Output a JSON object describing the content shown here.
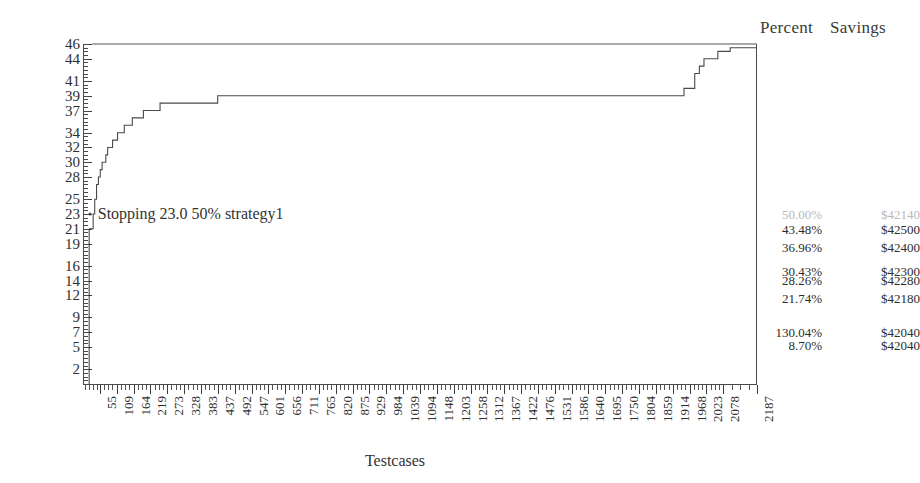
{
  "chart_data": {
    "type": "line",
    "title": "",
    "xlabel": "Testcases",
    "ylabel": "Faliures",
    "grid": false,
    "legend_position": "none",
    "xlim": [
      0,
      2187
    ],
    "ylim": [
      0,
      46
    ],
    "y_ticks": [
      46,
      44,
      41,
      39,
      37,
      34,
      32,
      30,
      28,
      25,
      23,
      21,
      19,
      16,
      14,
      12,
      9,
      7,
      5,
      2
    ],
    "x_ticks": [
      55,
      109,
      164,
      219,
      273,
      328,
      383,
      437,
      492,
      547,
      601,
      656,
      711,
      765,
      820,
      875,
      929,
      984,
      1039,
      1094,
      1148,
      1203,
      1258,
      1312,
      1367,
      1422,
      1476,
      1531,
      1586,
      1640,
      1695,
      1750,
      1804,
      1859,
      1914,
      1968,
      2023,
      2078,
      2187
    ],
    "series": [
      {
        "name": "total-reference",
        "color": "#555555",
        "x": [
          30,
          2187
        ],
        "values": [
          46,
          46
        ]
      },
      {
        "name": "cumulative-failures",
        "color": "#4a4a4a",
        "x": [
          20,
          28,
          33,
          38,
          44,
          50,
          56,
          62,
          68,
          74,
          80,
          88,
          96,
          104,
          112,
          122,
          134,
          146,
          160,
          176,
          196,
          220,
          250,
          285,
          330,
          380,
          437,
          500,
          560,
          620,
          700,
          800,
          900,
          1000,
          1100,
          1200,
          1300,
          1400,
          1500,
          1600,
          1700,
          1800,
          1900,
          1950,
          1985,
          2000,
          2015,
          2030,
          2060,
          2100,
          2187
        ],
        "values": [
          21,
          21,
          23,
          25,
          27,
          28,
          29,
          30,
          30,
          31,
          32,
          32,
          33,
          33,
          34,
          34,
          35,
          35,
          36,
          36,
          37,
          37,
          38,
          38,
          38,
          38,
          39,
          39,
          39,
          39,
          39,
          39,
          39,
          39,
          39,
          39,
          39,
          39,
          39,
          39,
          39,
          39,
          39,
          40,
          42,
          43,
          44,
          44,
          45,
          45.5,
          45.5
        ]
      }
    ],
    "annotations": [
      {
        "text": "Stopping 23.0 50% strategy1",
        "x": 22,
        "y": 23
      }
    ]
  },
  "header": {
    "percent_label": "Percent",
    "savings_label": "Savings"
  },
  "axes": {
    "y_title": "Faliures",
    "x_title": "Testcases"
  },
  "annotation": {
    "stopping_text": "Stopping 23.0 50% strategy1"
  },
  "table": {
    "columns": [
      "Percent",
      "Savings"
    ],
    "rows": [
      {
        "percent": "50.00%",
        "savings": "$42140",
        "y": 23.0,
        "style": "faded"
      },
      {
        "percent": "43.48%",
        "savings": "$42500",
        "y": 21.0,
        "style": "normal"
      },
      {
        "percent": "36.96%",
        "savings": "$42400",
        "y": 18.6,
        "style": "normal"
      },
      {
        "percent": "30.43%",
        "savings": "$42300",
        "y": 15.3,
        "style": "normal"
      },
      {
        "percent": "28.26%",
        "savings": "$42280",
        "y": 14.1,
        "style": "normal"
      },
      {
        "percent": "21.74%",
        "savings": "$42180",
        "y": 11.6,
        "style": "normal"
      },
      {
        "percent": "130.04%",
        "savings": "$42040",
        "y": 7.0,
        "style": "normal"
      },
      {
        "percent": "8.70%",
        "savings": "$42040",
        "y": 5.3,
        "style": "normal"
      }
    ]
  }
}
